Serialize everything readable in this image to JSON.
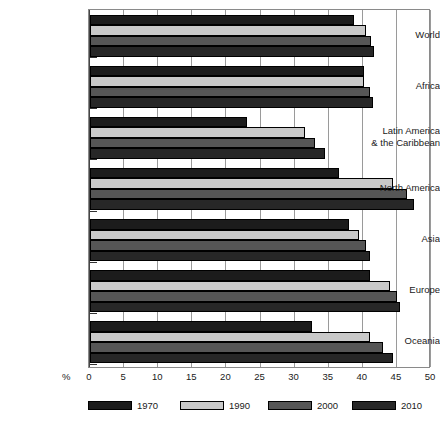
{
  "chart_data": {
    "type": "bar",
    "orientation": "horizontal",
    "title": "",
    "xlabel": "%",
    "ylabel": "",
    "xlim": [
      0,
      50
    ],
    "xticks": [
      0,
      5,
      10,
      15,
      20,
      25,
      30,
      35,
      40,
      45,
      50
    ],
    "grid": true,
    "legend_position": "bottom",
    "categories": [
      "World",
      "Africa",
      "Latin America & the Caribbean",
      "North America",
      "Asia",
      "Europe",
      "Oceania"
    ],
    "category_lines": [
      [
        "World"
      ],
      [
        "Africa"
      ],
      [
        "Latin America",
        "& the Caribbean"
      ],
      [
        "North America"
      ],
      [
        "Asia"
      ],
      [
        "Europe"
      ],
      [
        "Oceania"
      ]
    ],
    "series": [
      {
        "name": "1970",
        "color": "#1c1c1c",
        "values": [
          38.7,
          40.2,
          23.0,
          36.5,
          38.0,
          41.0,
          32.5
        ]
      },
      {
        "name": "1990",
        "color": "#c9c9c9",
        "values": [
          40.5,
          40.2,
          31.5,
          44.5,
          39.5,
          44.0,
          41.0
        ]
      },
      {
        "name": "2000",
        "color": "#565656",
        "values": [
          41.2,
          41.0,
          33.0,
          46.5,
          40.5,
          45.0,
          43.0
        ]
      },
      {
        "name": "2010",
        "color": "#272727",
        "values": [
          41.7,
          41.5,
          34.5,
          47.5,
          41.0,
          45.5,
          44.5
        ]
      }
    ]
  }
}
